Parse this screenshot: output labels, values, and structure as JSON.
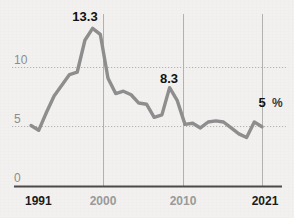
{
  "chart_data": {
    "type": "line",
    "title": "",
    "subtitle": "",
    "xlabel": "",
    "ylabel": "",
    "unit_label": "%",
    "grid": "horizontal-dotted-plus-vertical-year-lines",
    "legend": "none",
    "xlim": [
      1991,
      2021
    ],
    "ylim": [
      0,
      13.8
    ],
    "yticks": [
      0,
      5,
      10
    ],
    "ytick_labels": [
      "0",
      "5",
      "10"
    ],
    "xticks": [
      1991,
      2000,
      2010,
      2021
    ],
    "xtick_labels": [
      "1991",
      "2000",
      "2010",
      "2021"
    ],
    "xtick_emphasis": [
      "strong",
      "muted",
      "muted",
      "strong"
    ],
    "x": [
      1991,
      1992,
      1993,
      1994,
      1995,
      1996,
      1997,
      1998,
      1999,
      2000,
      2001,
      2002,
      2003,
      2004,
      2005,
      2006,
      2007,
      2008,
      2009,
      2010,
      2011,
      2012,
      2013,
      2014,
      2015,
      2016,
      2017,
      2018,
      2019,
      2020,
      2021
    ],
    "values": [
      5.1,
      4.7,
      6.2,
      7.6,
      8.5,
      9.4,
      9.6,
      12.3,
      13.3,
      12.8,
      9.1,
      7.8,
      8.0,
      7.7,
      7.0,
      6.9,
      5.8,
      6.0,
      8.3,
      7.2,
      5.2,
      5.3,
      4.9,
      5.4,
      5.5,
      5.4,
      4.9,
      4.4,
      4.1,
      5.4,
      5.0
    ],
    "series": [
      {
        "name": "Arbeitslosenquote",
        "color": "#8e8e8e",
        "values": [
          5.1,
          4.7,
          6.2,
          7.6,
          8.5,
          9.4,
          9.6,
          12.3,
          13.3,
          12.8,
          9.1,
          7.8,
          8.0,
          7.7,
          7.0,
          6.9,
          5.8,
          6.0,
          8.3,
          7.2,
          5.2,
          5.3,
          4.9,
          5.4,
          5.5,
          5.4,
          4.9,
          4.4,
          4.1,
          5.4,
          5.0
        ]
      }
    ],
    "annotations": [
      {
        "key": "peak",
        "text": "13.3",
        "x": 1999,
        "y": 13.3
      },
      {
        "key": "bump",
        "text": "8.3",
        "x": 2009,
        "y": 8.3
      },
      {
        "key": "current",
        "text": "5",
        "unit": "%",
        "x": 2021,
        "y": 5.0
      }
    ],
    "colors": {
      "background": "#f2f1ef",
      "line": "#8e8e8e",
      "grid": "#b9b7b4",
      "vertical_grid": "#b3b1ae",
      "axis": "#4a4a4a",
      "tick_label": "#8d8d8d",
      "tick_label_strong": "#1c1c1c",
      "annotation": "#111111"
    }
  },
  "axis": {
    "y": {
      "t0": "0",
      "t5": "5",
      "t10": "10"
    },
    "x": {
      "t1991": "1991",
      "t2000": "2000",
      "t2010": "2010",
      "t2021": "2021"
    }
  },
  "annotations": {
    "peak_label": "13.3",
    "bump_label": "8.3",
    "current_label": "5",
    "current_unit": "%"
  }
}
